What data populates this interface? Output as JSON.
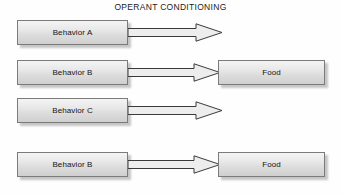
{
  "title": "OPERANT CONDITIONING",
  "colors": {
    "box_border": "#7b7b7b",
    "box_fill_top": "#f4f4f4",
    "box_fill_bottom": "#cfcfcf",
    "arrow_outline": "#3a3a3a",
    "arrow_fill": "#ededed",
    "text": "#151515",
    "background": "#fefefe"
  },
  "rows": [
    {
      "id": "row1",
      "behavior_label": "Behavior A",
      "arrow": "right-arrow-icon",
      "outcome_label": null
    },
    {
      "id": "row2",
      "behavior_label": "Behavior B",
      "arrow": "right-arrow-icon",
      "outcome_label": "Food"
    },
    {
      "id": "row3",
      "behavior_label": "Behavior C",
      "arrow": "right-arrow-icon",
      "outcome_label": null
    },
    {
      "id": "row4",
      "behavior_label": "Behavior B",
      "arrow": "right-arrow-icon",
      "outcome_label": "Food"
    }
  ]
}
